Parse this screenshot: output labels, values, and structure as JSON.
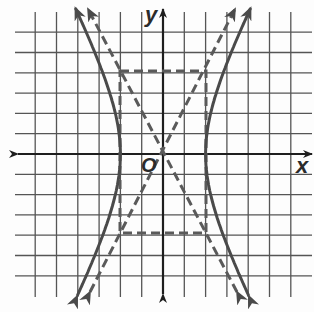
{
  "diagram": {
    "type": "hyperbola-graph",
    "labels": {
      "x_axis": "x",
      "y_axis": "y",
      "origin": "O"
    },
    "colors": {
      "grid": "#555555",
      "axis": "#1e1e1e",
      "curve": "#4a4a4a",
      "dashed": "#5a5a5a",
      "background": "#fdfdfd"
    }
  },
  "chart_data": {
    "type": "line",
    "title": "",
    "xlabel": "x",
    "ylabel": "y",
    "grid": true,
    "xlim": [
      -6,
      6
    ],
    "ylim": [
      -6,
      6
    ],
    "equation": "x^2/4 - y^2/16 = 1",
    "a": 2,
    "b": 4,
    "vertices": [
      [
        -2,
        0
      ],
      [
        2,
        0
      ]
    ],
    "asymptotes": [
      "y = 2x",
      "y = -2x"
    ],
    "central_rectangle": {
      "x": [
        -2,
        2
      ],
      "y": [
        -4,
        4
      ],
      "style": "dashed"
    },
    "series": [
      {
        "name": "hyperbola-left-branch",
        "style": "solid",
        "arrows": true
      },
      {
        "name": "hyperbola-right-branch",
        "style": "solid",
        "arrows": true
      },
      {
        "name": "asymptote y=2x",
        "style": "dashed",
        "arrows": true
      },
      {
        "name": "asymptote y=-2x",
        "style": "dashed",
        "arrows": true
      }
    ]
  }
}
